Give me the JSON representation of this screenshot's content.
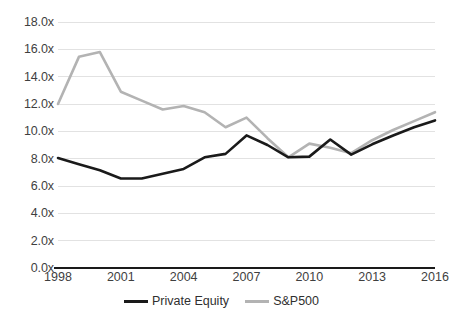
{
  "chart_data": {
    "type": "line",
    "title": "",
    "xlabel": "",
    "ylabel": "",
    "x": [
      1998,
      1999,
      2000,
      2001,
      2002,
      2003,
      2004,
      2005,
      2006,
      2007,
      2008,
      2009,
      2010,
      2011,
      2012,
      2013,
      2014,
      2015,
      2016
    ],
    "xlim": [
      1998,
      2016
    ],
    "ylim": [
      0,
      18
    ],
    "y_tick_labels": [
      "0.0x",
      "2.0x",
      "4.0x",
      "6.0x",
      "8.0x",
      "10.0x",
      "12.0x",
      "14.0x",
      "16.0x",
      "18.0x"
    ],
    "y_tick_values": [
      0,
      2,
      4,
      6,
      8,
      10,
      12,
      14,
      16,
      18
    ],
    "x_tick_labels": [
      "1998",
      "2001",
      "2004",
      "2007",
      "2010",
      "2013",
      "2016"
    ],
    "x_tick_values": [
      1998,
      2001,
      2004,
      2007,
      2010,
      2013,
      2016
    ],
    "grid": true,
    "grid_axis": "y",
    "legend_position": "bottom",
    "series": [
      {
        "name": "Private Equity",
        "color": "#1a1a1a",
        "values": [
          8.05,
          7.6,
          7.15,
          6.55,
          6.55,
          6.9,
          7.25,
          8.1,
          8.35,
          9.7,
          9.0,
          8.1,
          8.15,
          9.4,
          8.3,
          9.05,
          9.7,
          10.3,
          10.8
        ]
      },
      {
        "name": "S&P500",
        "color": "#b3b3b3",
        "values": [
          12.0,
          15.45,
          15.8,
          12.9,
          12.25,
          11.6,
          11.85,
          11.4,
          10.3,
          11.0,
          9.5,
          8.1,
          9.1,
          8.8,
          8.4,
          9.35,
          10.1,
          10.75,
          11.4
        ]
      }
    ]
  },
  "legend": {
    "items": [
      {
        "label": "Private Equity",
        "color": "#1a1a1a"
      },
      {
        "label": "S&P500",
        "color": "#b3b3b3"
      }
    ]
  },
  "colors": {
    "background": "#ffffff",
    "gridline": "#e2e2e2",
    "axis_line": "#1a1a1a",
    "tick_text": "#3f3f3f",
    "private_equity": "#1a1a1a",
    "sp500": "#b3b3b3"
  }
}
